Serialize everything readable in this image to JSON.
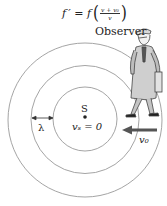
{
  "formula": {
    "lhs": "f ′ = f",
    "numerator": "v + v₀",
    "denominator": "v",
    "open_paren": "(",
    "close_paren": ")"
  },
  "labels": {
    "observer": "Observer",
    "source": "S",
    "source_velocity": "vₛ = 0",
    "wavelength": "λ",
    "observer_velocity": "v₀"
  },
  "geometry": {
    "center": [
      85,
      119
    ],
    "wavefront_radii": [
      32,
      54,
      77
    ]
  },
  "colors": {
    "wavefront": "#9a9a9a",
    "arrow": "#555555",
    "text": "#222222"
  }
}
